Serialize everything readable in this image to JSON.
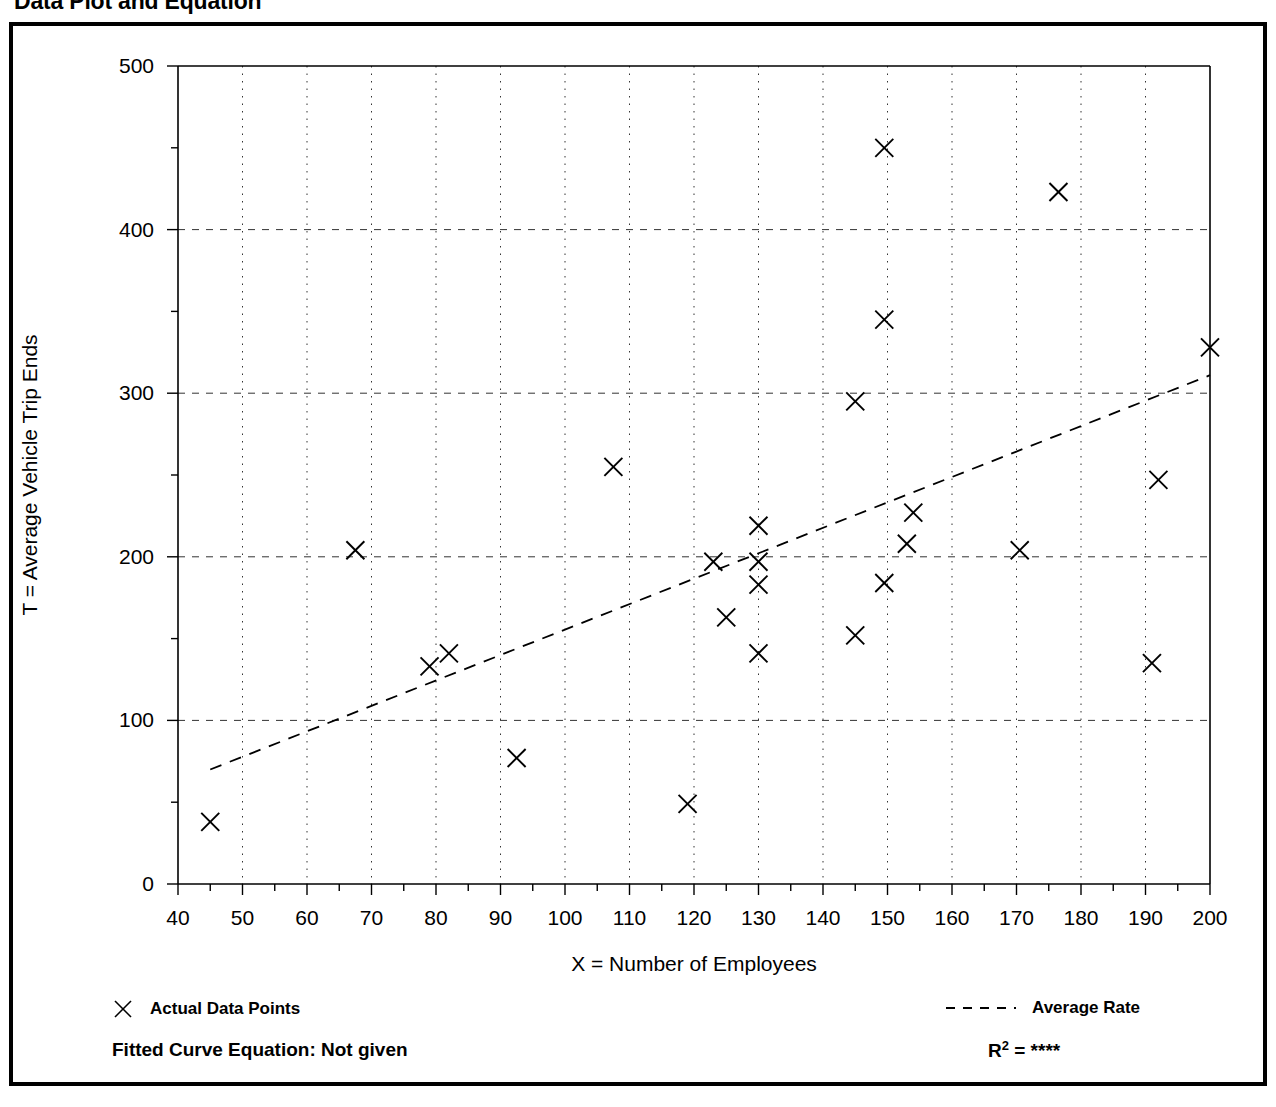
{
  "page": {
    "title": "Data Plot and Equation"
  },
  "legend": {
    "points_label": "Actual Data Points",
    "rate_label": "Average Rate",
    "point_marker_icon": "x-marker-icon",
    "rate_marker_icon": "dashed-line-icon"
  },
  "footer": {
    "equation_label": "Fitted Curve Equation:  Not given",
    "r_squared_prefix": "R",
    "r_squared_exponent": "2",
    "r_squared_value": "= ****"
  },
  "chart_data": {
    "type": "scatter",
    "title": "Data Plot and Equation",
    "xlabel": "X = Number of Employees",
    "ylabel": "T = Average Vehicle Trip Ends",
    "xlim": [
      40,
      200
    ],
    "ylim": [
      0,
      500
    ],
    "xticks": [
      40,
      50,
      60,
      70,
      80,
      90,
      100,
      110,
      120,
      130,
      140,
      150,
      160,
      170,
      180,
      190,
      200
    ],
    "yticks": [
      0,
      100,
      200,
      300,
      400,
      500
    ],
    "x_minor_step": 5,
    "y_minor_step": 50,
    "grid": true,
    "grid_style": "dotted",
    "legend_position": "below-axes",
    "series": [
      {
        "name": "Actual Data Points",
        "marker": "x",
        "color": "#000000",
        "points": [
          [
            45,
            38
          ],
          [
            67.5,
            204
          ],
          [
            79,
            133
          ],
          [
            82,
            141
          ],
          [
            92.5,
            77
          ],
          [
            107.5,
            255
          ],
          [
            119,
            49
          ],
          [
            123,
            197
          ],
          [
            125,
            163
          ],
          [
            130,
            219
          ],
          [
            130,
            197
          ],
          [
            130,
            183
          ],
          [
            130,
            141
          ],
          [
            145,
            152
          ],
          [
            145,
            295
          ],
          [
            149.5,
            184
          ],
          [
            149.5,
            345
          ],
          [
            149.5,
            450
          ],
          [
            153,
            208
          ],
          [
            154,
            227
          ],
          [
            170.5,
            204
          ],
          [
            176.5,
            423
          ],
          [
            191,
            135
          ],
          [
            192,
            247
          ],
          [
            200,
            328
          ]
        ]
      },
      {
        "name": "Average Rate",
        "type": "line",
        "style": "dashed",
        "color": "#000000",
        "points": [
          [
            45,
            70
          ],
          [
            200,
            311
          ]
        ]
      }
    ]
  }
}
